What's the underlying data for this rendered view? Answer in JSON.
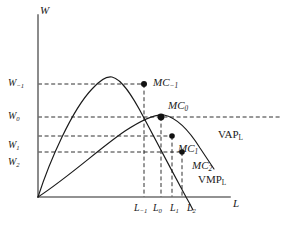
{
  "figure": {
    "type": "economics-diagram",
    "background": "#ffffff",
    "ink": "#1a1a1a"
  },
  "axes": {
    "y_axis_label": "W",
    "x_axis_label": "L",
    "origin_px": [
      38,
      197
    ],
    "x_end_px": [
      230,
      197
    ],
    "y_top_px": [
      38,
      15
    ]
  },
  "wage_levels": [
    {
      "key": "w_minus1",
      "label": "W",
      "sub": "−1",
      "y_px": 84,
      "dash_end_px": 144,
      "label_x": 8,
      "label_y": 78
    },
    {
      "key": "w_0",
      "label": "W",
      "sub": "0",
      "y_px": 117,
      "dash_end_px": 281,
      "label_x": 8,
      "label_y": 111
    },
    {
      "key": "w_1",
      "label": "W",
      "sub": "1",
      "y_px": 136,
      "dash_end_px": 172,
      "label_x": 8,
      "label_y": 140
    },
    {
      "key": "w_2",
      "label": "W",
      "sub": "2",
      "y_px": 152,
      "dash_end_px": 182,
      "label_x": 8,
      "label_y": 157
    }
  ],
  "labour_levels": [
    {
      "key": "l_minus1",
      "label": "L",
      "sub": "−1",
      "x_px": 144,
      "label_x": 134,
      "label_y": 203
    },
    {
      "key": "l_0",
      "label": "L",
      "sub": "0",
      "x_px": 161,
      "label_x": 153,
      "label_y": 203
    },
    {
      "key": "l_1",
      "label": "L",
      "sub": "1",
      "x_px": 172,
      "label_x": 170,
      "label_y": 203
    },
    {
      "key": "l_2",
      "label": "L",
      "sub": "2",
      "x_px": 182,
      "label_x": 187,
      "label_y": 203
    }
  ],
  "marginal_cost_points": [
    {
      "key": "mc_minus1",
      "label": "MC",
      "sub": "−1",
      "x_px": 144,
      "y_px": 84,
      "label_x": 153,
      "label_y": 78,
      "r": 3.0
    },
    {
      "key": "mc_0",
      "label": "MC",
      "sub": "0",
      "x_px": 161,
      "y_px": 117,
      "label_x": 168,
      "label_y": 101,
      "r": 3.4
    },
    {
      "key": "mc_1",
      "label": "MC",
      "sub": "1",
      "x_px": 172,
      "y_px": 136,
      "label_x": 178,
      "label_y": 144,
      "r": 2.8
    },
    {
      "key": "mc_2",
      "label": "MC",
      "sub": "2",
      "x_px": 182,
      "y_px": 152,
      "label_x": 192,
      "label_y": 161,
      "r": 2.8
    }
  ],
  "curves": [
    {
      "key": "vap_l",
      "label": "VAP",
      "sub": "L",
      "label_x": 218,
      "label_y": 130,
      "path": "M 38 197 C 70 176 100 148 125 131 C 145 118 157 114 164 115 C 178 118 190 132 200 148 C 206 157 210 163 214 169",
      "peak_px": [
        164,
        115
      ]
    },
    {
      "key": "vmp_l",
      "label": "VMP",
      "sub": "L",
      "label_x": 198,
      "label_y": 175,
      "path": "M 38 197 C 50 160 72 110 92 89 C 100 80 107 76 112 77 C 122 79 133 97 144 118 C 156 141 172 171 186 197 C 189 202 191 206 193 210",
      "peak_px": [
        110,
        77
      ]
    }
  ]
}
